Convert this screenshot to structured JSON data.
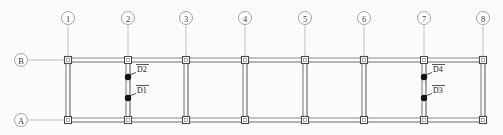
{
  "diagram": {
    "type": "structural-frame-plan",
    "canvas": {
      "width": 503,
      "height": 135,
      "background": "#fbfbfb"
    },
    "colors": {
      "member": "#8a8a8a",
      "member_dark": "#6e6e6e",
      "joint_outline": "#4a4a4a",
      "grid_line": "#a8a8a8",
      "bubble_outline": "#9a9a9a",
      "bubble_text": "#3a3a3a",
      "damper_marker": "#111111",
      "leader": "#2b2b2b",
      "label_text": "#1a1a1a"
    },
    "grid": {
      "column_lines": [
        {
          "label": "1",
          "x": 68
        },
        {
          "label": "2",
          "x": 128
        },
        {
          "label": "3",
          "x": 186
        },
        {
          "label": "4",
          "x": 245
        },
        {
          "label": "5",
          "x": 305
        },
        {
          "label": "6",
          "x": 364
        },
        {
          "label": "7",
          "x": 424
        },
        {
          "label": "8",
          "x": 483
        }
      ],
      "row_lines": [
        {
          "label": "B",
          "y": 60
        },
        {
          "label": "A",
          "y": 120
        }
      ],
      "bubble_radius": 6.5,
      "column_bubble_y": 18,
      "row_bubble_x": 21
    },
    "markers": [
      {
        "label": "D1",
        "x": 128,
        "y": 98,
        "label_x": 137,
        "label_y": 90
      },
      {
        "label": "D2",
        "x": 128,
        "y": 77,
        "label_x": 137,
        "label_y": 69
      },
      {
        "label": "D3",
        "x": 424,
        "y": 98,
        "label_x": 433,
        "label_y": 90
      },
      {
        "label": "D4",
        "x": 424,
        "y": 77,
        "label_x": 433,
        "label_y": 69
      }
    ],
    "marker_radius": 3.2,
    "joint_size": 7,
    "member_gap": 4
  }
}
